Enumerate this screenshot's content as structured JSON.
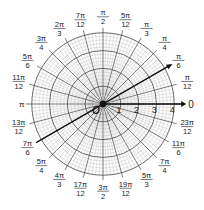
{
  "diagram": {
    "type": "polar-grid",
    "center": {
      "x": 103,
      "y": 104
    },
    "ring_radius_px": 17.8,
    "rings": [
      1,
      2,
      3,
      4
    ],
    "radial_labels": [
      "1",
      "2",
      "3",
      "4"
    ],
    "origin_label": "O",
    "polar_axis_label": "0",
    "pi_label": "π",
    "angle_labels": [
      {
        "angle_deg": 15,
        "num": "π",
        "den": "12"
      },
      {
        "angle_deg": 30,
        "num": "π",
        "den": "6"
      },
      {
        "angle_deg": 45,
        "num": "π",
        "den": "4"
      },
      {
        "angle_deg": 60,
        "num": "π",
        "den": "3"
      },
      {
        "angle_deg": 75,
        "num": "5π",
        "den": "12"
      },
      {
        "angle_deg": 90,
        "num": "π",
        "den": "2"
      },
      {
        "angle_deg": 105,
        "num": "7π",
        "den": "12"
      },
      {
        "angle_deg": 120,
        "num": "2π",
        "den": "3"
      },
      {
        "angle_deg": 135,
        "num": "3π",
        "den": "4"
      },
      {
        "angle_deg": 150,
        "num": "5π",
        "den": "6"
      },
      {
        "angle_deg": 165,
        "num": "11π",
        "den": "12"
      },
      {
        "angle_deg": 195,
        "num": "13π",
        "den": "12"
      },
      {
        "angle_deg": 210,
        "num": "7π",
        "den": "6"
      },
      {
        "angle_deg": 225,
        "num": "5π",
        "den": "4"
      },
      {
        "angle_deg": 240,
        "num": "4π",
        "den": "3"
      },
      {
        "angle_deg": 255,
        "num": "17π",
        "den": "12"
      },
      {
        "angle_deg": 270,
        "num": "3π",
        "den": "2"
      },
      {
        "angle_deg": 285,
        "num": "19π",
        "den": "12"
      },
      {
        "angle_deg": 300,
        "num": "5π",
        "den": "3"
      },
      {
        "angle_deg": 315,
        "num": "7π",
        "den": "4"
      },
      {
        "angle_deg": 330,
        "num": "11π",
        "den": "6"
      },
      {
        "angle_deg": 345,
        "num": "23π",
        "den": "12"
      }
    ],
    "highlighted_line": {
      "angles_deg": [
        30,
        210
      ],
      "description": "line through origin at θ = π/6"
    },
    "colors": {
      "grid_major": "#444444",
      "grid_minor": "#bbbbbb",
      "bold": "#111111"
    }
  }
}
